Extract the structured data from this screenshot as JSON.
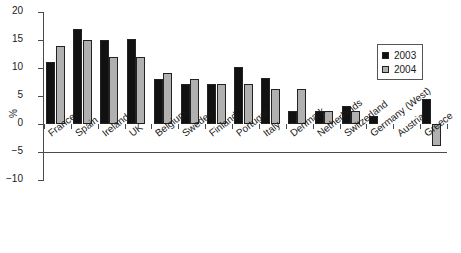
{
  "chart_data": {
    "type": "bar",
    "title": "",
    "xlabel": "",
    "ylabel": "%",
    "ylim": [
      -10,
      20
    ],
    "yticks": [
      20,
      15,
      10,
      5,
      0,
      -5,
      -10
    ],
    "ytick_labels": [
      "20",
      "15",
      "10",
      "5",
      "0",
      "−5",
      "−10"
    ],
    "grid": false,
    "legend_position": "top-right",
    "categories": [
      "France",
      "Spain",
      "Ireland",
      "UK",
      "Belgium",
      "Sweden",
      "Finland",
      "Portugal",
      "Italy",
      "Denmark",
      "Netherlands",
      "Switzerland",
      "Germany (West)",
      "Austria",
      "Greece"
    ],
    "series": [
      {
        "name": "2003",
        "color": "#111111",
        "values": [
          11.0,
          17.0,
          15.0,
          15.1,
          8.1,
          7.1,
          7.2,
          10.2,
          8.2,
          2.3,
          2.3,
          3.3,
          1.4,
          0.0,
          4.4
        ]
      },
      {
        "name": "2004",
        "color": "#b0b0b0",
        "values": [
          14.0,
          15.0,
          12.0,
          12.0,
          9.1,
          8.1,
          7.2,
          7.2,
          6.3,
          6.3,
          2.3,
          2.3,
          0.0,
          0.0,
          -4.0
        ]
      }
    ]
  }
}
